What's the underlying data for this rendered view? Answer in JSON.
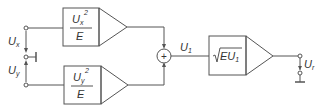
{
  "diagram": {
    "type": "block-diagram",
    "inputs": {
      "ux": {
        "label": "U",
        "sub": "x"
      },
      "uy": {
        "label": "U",
        "sub": "y"
      }
    },
    "blocks": {
      "square_x": {
        "num": "U",
        "num_sub": "x",
        "num_sup": "2",
        "den": "E"
      },
      "square_y": {
        "num": "U",
        "num_sub": "y",
        "num_sup": "2",
        "den": "E"
      },
      "summer": {
        "symbol": "+"
      },
      "sqrt": {
        "text": "EU",
        "sub": "1"
      }
    },
    "signals": {
      "u1": {
        "label": "U",
        "sub": "1"
      },
      "ur": {
        "label": "U",
        "sub": "r"
      }
    }
  }
}
